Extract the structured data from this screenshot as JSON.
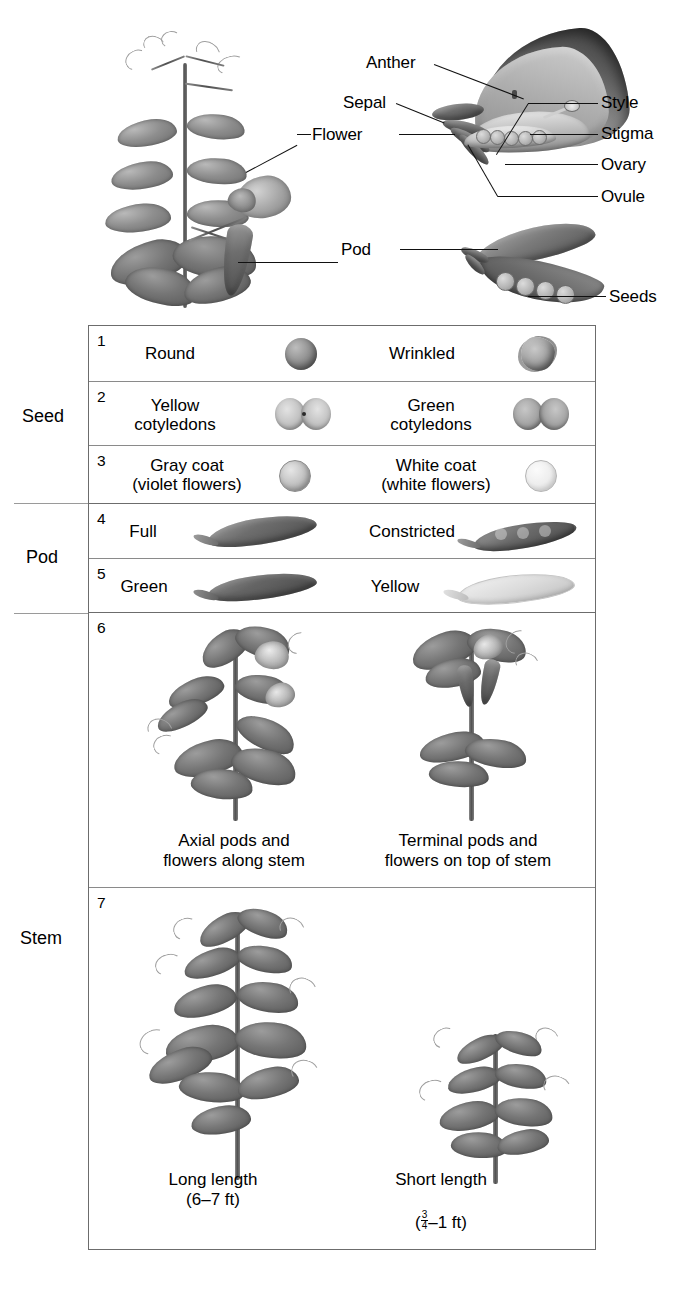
{
  "figure": {
    "domain": "biology-diagram"
  },
  "anatomy": {
    "labels": [
      {
        "name": "anther",
        "text": "Anther"
      },
      {
        "name": "sepal",
        "text": "Sepal"
      },
      {
        "name": "flower",
        "text": "Flower"
      },
      {
        "name": "style",
        "text": "Style"
      },
      {
        "name": "stigma",
        "text": "Stigma"
      },
      {
        "name": "ovary",
        "text": "Ovary"
      },
      {
        "name": "ovule",
        "text": "Ovule"
      },
      {
        "name": "pod",
        "text": "Pod"
      },
      {
        "name": "seeds",
        "text": "Seeds"
      }
    ]
  },
  "traits_table": {
    "group_labels": [
      {
        "key": "seed",
        "text": "Seed"
      },
      {
        "key": "pod",
        "text": "Pod"
      },
      {
        "key": "stem",
        "text": "Stem"
      }
    ],
    "rows": [
      {
        "number": "1",
        "group": "seed",
        "dominant": {
          "label": "Round",
          "art": "round-seed"
        },
        "recessive": {
          "label": "Wrinkled",
          "art": "wrinkled-seed"
        }
      },
      {
        "number": "2",
        "group": "seed",
        "dominant": {
          "label": "Yellow\ncotyledons",
          "art": "yellow-cotyledons"
        },
        "recessive": {
          "label": "Green\ncotyledons",
          "art": "green-cotyledons"
        }
      },
      {
        "number": "3",
        "group": "seed",
        "dominant": {
          "label": "Gray coat\n(violet flowers)",
          "art": "gray-coat-seed"
        },
        "recessive": {
          "label": "White coat\n(white flowers)",
          "art": "white-coat-seed"
        }
      },
      {
        "number": "4",
        "group": "pod",
        "dominant": {
          "label": "Full",
          "art": "full-pod"
        },
        "recessive": {
          "label": "Constricted",
          "art": "constricted-pod"
        }
      },
      {
        "number": "5",
        "group": "pod",
        "dominant": {
          "label": "Green",
          "art": "green-pod"
        },
        "recessive": {
          "label": "Yellow",
          "art": "yellow-pod"
        }
      },
      {
        "number": "6",
        "group": "stem",
        "dominant": {
          "label": "Axial pods and\nflowers along stem",
          "art": "axial-plant"
        },
        "recessive": {
          "label": "Terminal pods and\nflowers on top of stem",
          "art": "terminal-plant"
        }
      },
      {
        "number": "7",
        "group": "stem",
        "dominant": {
          "label": "Long length",
          "sublabel": "(6–7 ft)",
          "art": "tall-plant"
        },
        "recessive": {
          "label": "Short length",
          "sublabel_fraction": {
            "numerator": "3",
            "denominator": "4",
            "suffix": "–1 ft"
          },
          "art": "short-plant"
        }
      }
    ]
  },
  "colors": {
    "ink": "#000000",
    "table_border": "#6c6c6c",
    "row_rule": "#8a8a8a",
    "group_rule": "#9a9a9a",
    "background": "#ffffff"
  }
}
